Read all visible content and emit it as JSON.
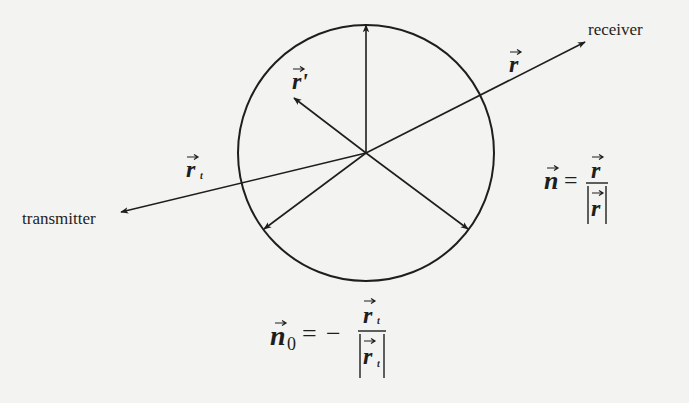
{
  "diagram": {
    "type": "scattering-geometry",
    "colors": {
      "background": "#f3f3f1",
      "ink": "#1e1e1e",
      "bleed_text": "#dcdcda"
    },
    "circle": {
      "cx": 366,
      "cy": 153,
      "r": 128
    },
    "labels": {
      "receiver": "receiver",
      "transmitter": "transmitter",
      "r_vector": "r",
      "r_prime_vector": "r'",
      "r_t_vector": "r",
      "r_t_subscript": "t"
    },
    "formulas": {
      "n_unit": {
        "lhs": "n",
        "equals": "=",
        "numerator": "r",
        "denominator": "|r|"
      },
      "n0_unit": {
        "lhs": "n",
        "lhs_subscript": "0",
        "equals": "=",
        "sign": "−",
        "numerator": "r",
        "numerator_subscript": "t",
        "denominator": "|r|",
        "denominator_subscript": "t"
      }
    },
    "arrows": [
      {
        "name": "up-arrow",
        "from": [
          366,
          153
        ],
        "to": [
          366,
          23
        ]
      },
      {
        "name": "r-prime-arrow",
        "from": [
          366,
          153
        ],
        "to": [
          293,
          97
        ]
      },
      {
        "name": "r-arrow-to-receiver",
        "from": [
          366,
          153
        ],
        "to": [
          585,
          42
        ]
      },
      {
        "name": "r-t-arrow-to-transmitter",
        "from": [
          366,
          153
        ],
        "to": [
          120,
          213
        ]
      },
      {
        "name": "lower-left-arrow",
        "from": [
          366,
          153
        ],
        "to": [
          263,
          230
        ]
      },
      {
        "name": "lower-right-arrow",
        "from": [
          366,
          153
        ],
        "to": [
          469,
          230
        ]
      }
    ]
  }
}
